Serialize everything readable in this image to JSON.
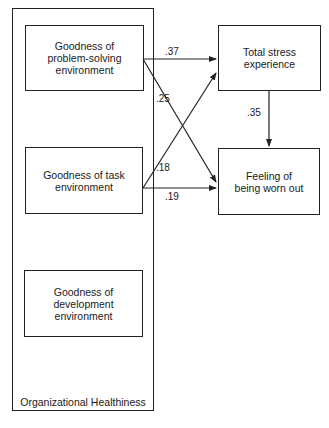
{
  "diagram": {
    "container": {
      "label": "Organizational Healthiness"
    },
    "left_nodes": [
      {
        "id": "problem-solving",
        "label": "Goodness of\nproblem-solving\nenvironment"
      },
      {
        "id": "task",
        "label": "Goodness of task\nenvironment"
      },
      {
        "id": "development",
        "label": "Goodness of\ndevelopment\nenvironment"
      }
    ],
    "right_nodes": [
      {
        "id": "stress",
        "label": "Total stress\nexperience"
      },
      {
        "id": "worn-out",
        "label": "Feeling of\nbeing worn out"
      }
    ],
    "edges": [
      {
        "from": "problem-solving",
        "to": "stress",
        "coefficient": ".37"
      },
      {
        "from": "problem-solving",
        "to": "worn-out",
        "coefficient": ".25"
      },
      {
        "from": "task",
        "to": "stress",
        "coefficient": ".18"
      },
      {
        "from": "task",
        "to": "worn-out",
        "coefficient": ".19"
      },
      {
        "from": "stress",
        "to": "worn-out",
        "coefficient": ".35"
      }
    ],
    "stroke_color": "#222222"
  }
}
